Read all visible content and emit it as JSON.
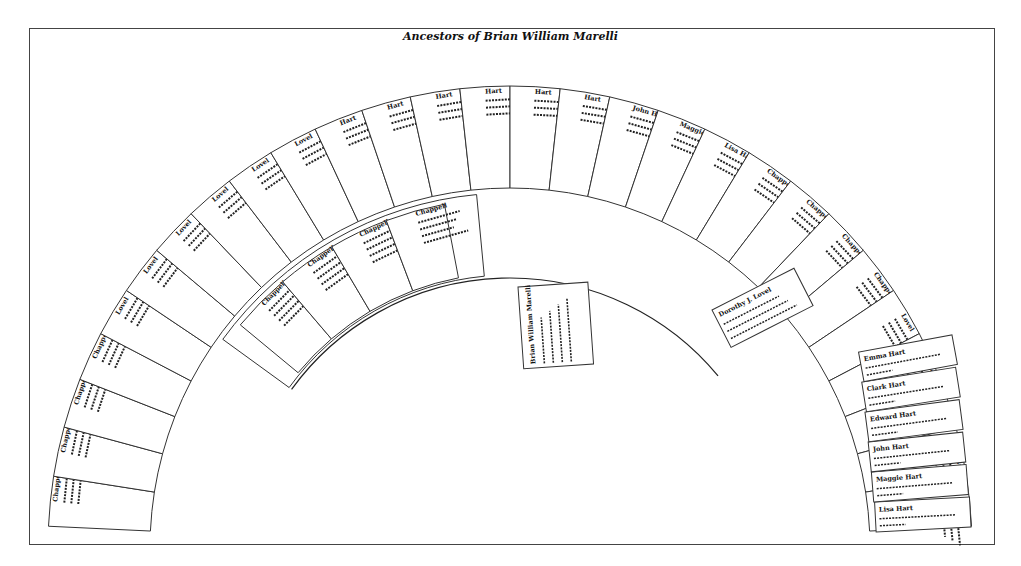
{
  "title": "Ancestors of Brian William Marelli",
  "chart_data": {
    "type": "fan_chart",
    "root": {
      "name": "Brian William Marelli",
      "lines": [
        "b. unreadable",
        "m. unreadable"
      ]
    },
    "center": {
      "x": 510,
      "y": 545
    },
    "generations": [
      {
        "level": 1,
        "inner_r": 0,
        "outer_r": 0,
        "note": "root box shown vertically in center"
      },
      {
        "level": 2,
        "r_inner": 270,
        "r_outer": 355,
        "members": [
          {
            "name": "Chappell",
            "side": "paternal"
          },
          {
            "name": "Chappell",
            "side": "paternal"
          },
          {
            "name": "Chappell",
            "side": "paternal"
          },
          {
            "name": "Chappell",
            "side": "paternal"
          },
          {
            "name": "Dorothy J. Lovel",
            "side": "maternal"
          }
        ]
      },
      {
        "level": 3,
        "r_inner": 360,
        "r_outer": 455,
        "left_count": 12,
        "right_count": 16,
        "visible_names": [
          "Chappell",
          "Chappell",
          "Chappell",
          "Chappell",
          "Lovel",
          "Lovel",
          "Lovel",
          "Lovel",
          "Lovel",
          "Lovel",
          "Hart",
          "Hart",
          "Hart",
          "Hart",
          "Hart",
          "Hart",
          "John Hart",
          "Maggie Hart",
          "Lisa Hart"
        ]
      }
    ]
  },
  "labels": {
    "root_name": "Brian William Marelli",
    "right_bottom": [
      "Lisa Hart",
      "Maggie Hart",
      "John Hart",
      "Edward Hart",
      "Clark Hart",
      "Emma Hart"
    ],
    "mid_right": "Dorothy J. Lovel"
  }
}
